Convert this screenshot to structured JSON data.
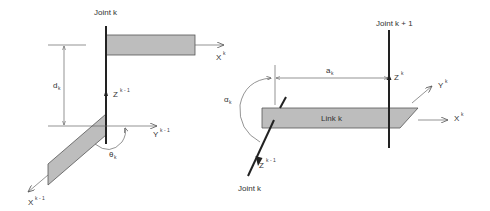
{
  "figure": {
    "colors": {
      "background": "#ffffff",
      "link_fill": "#bdbdbd",
      "axis_line": "#222222",
      "thin_line": "#666666",
      "text": "#333333"
    }
  },
  "left_panel": {
    "joint_label": "Joint k",
    "dimension": {
      "symbol": "d",
      "subscript": "k"
    },
    "angle": {
      "symbol": "θ",
      "subscript": "k"
    },
    "axes": {
      "z_prev": {
        "base": "Z",
        "sup": "k - 1"
      },
      "y_prev": {
        "base": "Y",
        "sup": "k - 1"
      },
      "x_prev": {
        "base": "X",
        "sup": "k - 1"
      },
      "x_curr": {
        "base": "X",
        "sup": "k"
      }
    }
  },
  "right_panel": {
    "joint_next_label": "Joint k + 1",
    "joint_label": "Joint k",
    "link_label": "Link k",
    "dimension": {
      "symbol": "a",
      "subscript": "k"
    },
    "angle": {
      "symbol": "α",
      "subscript": "k"
    },
    "axes": {
      "z_curr": {
        "base": "Z",
        "sup": "k"
      },
      "y_curr": {
        "base": "Y",
        "sup": "k"
      },
      "x_curr": {
        "base": "X",
        "sup": "k"
      },
      "z_prev": {
        "base": "Z",
        "sup": "k - 1"
      }
    }
  }
}
